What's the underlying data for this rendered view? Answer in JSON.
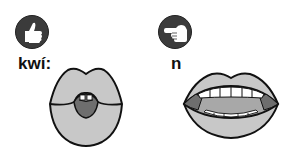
{
  "panels": [
    {
      "label": "kwí:",
      "hand_icon": "thumbs-up-icon",
      "mouth": "rounded-lips-protruded",
      "colors": {
        "badge": "#3b3b3b",
        "lip": "#c8c8c8",
        "tongue": "#6e6e6e",
        "teeth": "#ffffff",
        "outline": "#111111"
      }
    },
    {
      "label": "n",
      "hand_icon": "pointing-left-icon",
      "mouth": "open-mouth-teeth-visible",
      "colors": {
        "badge": "#3b3b3b",
        "lip": "#c8c8c8",
        "tongue": "#a8a8a8",
        "cheek": "#6e6e6e",
        "teeth": "#ffffff",
        "outline": "#111111"
      }
    }
  ]
}
